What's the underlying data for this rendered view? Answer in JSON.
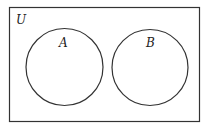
{
  "diagram": {
    "type": "venn",
    "universe": {
      "label": "U"
    },
    "sets": [
      {
        "label": "A"
      },
      {
        "label": "B"
      }
    ],
    "relationship": "disjoint",
    "colors": {
      "stroke": "#333333",
      "background": "#ffffff"
    }
  }
}
